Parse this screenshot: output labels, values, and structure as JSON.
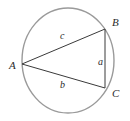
{
  "figure": {
    "kind": "inscribed-triangle-in-circle",
    "background_color": "#ffffff",
    "circle": {
      "stroke_color": "#9a9a9a",
      "stroke_width": 1.4,
      "center_x": 68,
      "center_y": 60.5,
      "radius_x": 46,
      "radius_y": 52.5
    },
    "triangle": {
      "stroke_color": "#3a3a3a",
      "stroke_width": 1,
      "fill": "none",
      "points": "22,64 105,29 105,88"
    },
    "vertices": [
      {
        "id": "A",
        "label": "A",
        "x": 22,
        "y": 64,
        "label_x": 9,
        "label_y": 60
      },
      {
        "id": "B",
        "label": "B",
        "x": 105,
        "y": 29,
        "label_x": 112,
        "label_y": 17
      },
      {
        "id": "C",
        "label": "C",
        "x": 105,
        "y": 88,
        "label_x": 112,
        "label_y": 88
      }
    ],
    "sides": [
      {
        "id": "a",
        "label": "a",
        "between": "B-C",
        "label_x": 98,
        "label_y": 57
      },
      {
        "id": "b",
        "label": "b",
        "between": "A-C",
        "label_x": 60,
        "label_y": 80
      },
      {
        "id": "c",
        "label": "c",
        "between": "A-B",
        "label_x": 60,
        "label_y": 31
      }
    ]
  }
}
